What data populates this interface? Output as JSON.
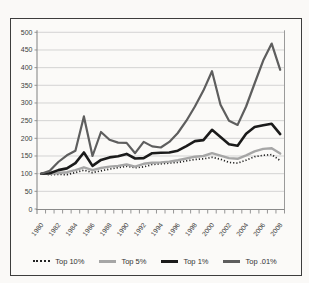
{
  "figure": {
    "background": "#faf9f7",
    "frame_color": "#3d3d3d"
  },
  "chart_data": {
    "type": "line",
    "title": "",
    "xlabel": "",
    "ylabel": "",
    "ylim": [
      0,
      500
    ],
    "yticks": [
      0,
      50,
      100,
      150,
      200,
      250,
      300,
      350,
      400,
      450,
      500
    ],
    "x_labels_shown": [
      "1980",
      "1982",
      "1984",
      "1986",
      "1988",
      "1990",
      "1992",
      "1994",
      "1996",
      "1998",
      "2000",
      "2002",
      "2004",
      "2006",
      "2008"
    ],
    "grid": "horizontal",
    "legend_position": "bottom",
    "colors": {
      "gridline": "#c9c9c9",
      "axis": "#8a8a8a",
      "plot_border": "#9a9a9a",
      "tick_label": "#3c3c3c"
    },
    "categories": [
      "1980",
      "1981",
      "1982",
      "1983",
      "1984",
      "1985",
      "1986",
      "1987",
      "1988",
      "1989",
      "1990",
      "1991",
      "1992",
      "1993",
      "1994",
      "1995",
      "1996",
      "1997",
      "1998",
      "1999",
      "2000",
      "2001",
      "2002",
      "2003",
      "2004",
      "2005",
      "2006",
      "2007",
      "2008"
    ],
    "series": [
      {
        "name": "Top 10%",
        "style": "dotted",
        "color": "#232323",
        "width": 1.7,
        "values": [
          100,
          97,
          98,
          97,
          103,
          110,
          103,
          108,
          113,
          117,
          121,
          117,
          119,
          126,
          128,
          130,
          132,
          136,
          140,
          142,
          146,
          141,
          132,
          130,
          138,
          148,
          152,
          154,
          137
        ]
      },
      {
        "name": "Top 5%",
        "style": "solid",
        "color": "#a6a6a6",
        "width": 2.4,
        "values": [
          100,
          100,
          102,
          104,
          110,
          118,
          110,
          116,
          120,
          122,
          126,
          120,
          128,
          131,
          132,
          134,
          138,
          143,
          148,
          150,
          158,
          151,
          144,
          142,
          152,
          163,
          170,
          172,
          157
        ]
      },
      {
        "name": "Top 1%",
        "style": "solid",
        "color": "#1b1b1b",
        "width": 2.6,
        "values": [
          100,
          101,
          110,
          115,
          130,
          160,
          122,
          139,
          146,
          149,
          156,
          143,
          144,
          158,
          159,
          160,
          165,
          178,
          192,
          195,
          224,
          204,
          183,
          179,
          213,
          232,
          237,
          241,
          212
        ]
      },
      {
        "name": "Top .01%",
        "style": "solid",
        "color": "#5e5e5e",
        "width": 2.2,
        "values": [
          100,
          108,
          133,
          152,
          165,
          262,
          150,
          218,
          196,
          188,
          187,
          158,
          190,
          177,
          174,
          190,
          215,
          250,
          290,
          335,
          390,
          295,
          250,
          238,
          290,
          355,
          420,
          468,
          394
        ]
      }
    ]
  },
  "legend": {
    "items": [
      {
        "label": "Top 10%"
      },
      {
        "label": "Top 5%"
      },
      {
        "label": "Top 1%"
      },
      {
        "label": "Top .01%"
      }
    ]
  }
}
